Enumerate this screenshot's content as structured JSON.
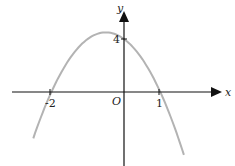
{
  "chart_data": {
    "type": "line",
    "title": "",
    "xlabel": "x",
    "ylabel": "y",
    "origin_label": "O",
    "function": "y = -2(x+2)(x-1)",
    "x_ticks": [
      {
        "value": -2,
        "label": "-2"
      },
      {
        "value": 1,
        "label": "1"
      }
    ],
    "y_ticks": [
      {
        "value": 4,
        "label": "4"
      }
    ],
    "series": [
      {
        "name": "parabola",
        "color": "#b0b0b0",
        "x": [
          -2.5,
          -2,
          -1.5,
          -1,
          -0.5,
          0,
          0.5,
          1,
          1.5
        ],
        "y": [
          -3,
          0,
          2.5,
          4,
          4.5,
          4,
          2.5,
          0,
          -5
        ]
      }
    ],
    "xlim": [
      -2.5,
      1.7
    ],
    "ylim": [
      -5.5,
      6
    ]
  },
  "labels": {
    "x_axis": "x",
    "y_axis": "y",
    "origin": "O",
    "tick_x_neg2": "-2",
    "tick_x_1": "1",
    "tick_y_4": "4"
  }
}
